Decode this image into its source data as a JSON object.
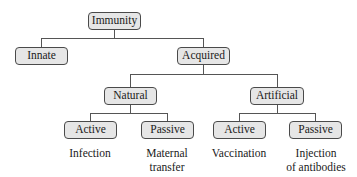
{
  "diagram": {
    "type": "tree",
    "root": "Immunity",
    "nodes": {
      "immunity": "Immunity",
      "innate": "Innate",
      "acquired": "Acquired",
      "natural": "Natural",
      "artificial": "Artificial",
      "natural_active": "Active",
      "natural_passive": "Passive",
      "artificial_active": "Active",
      "artificial_passive": "Passive"
    },
    "examples": {
      "natural_active": "Infection",
      "natural_passive_line1": "Maternal",
      "natural_passive_line2": "transfer",
      "artificial_active": "Vaccination",
      "artificial_passive_line1": "Injection",
      "artificial_passive_line2": "of antibodies"
    },
    "edges": [
      [
        "Immunity",
        "Innate"
      ],
      [
        "Immunity",
        "Acquired"
      ],
      [
        "Acquired",
        "Natural"
      ],
      [
        "Acquired",
        "Artificial"
      ],
      [
        "Natural",
        "Active"
      ],
      [
        "Natural",
        "Passive"
      ],
      [
        "Artificial",
        "Active"
      ],
      [
        "Artificial",
        "Passive"
      ]
    ],
    "colors": {
      "node_fill": "#e6e6e6",
      "node_border": "#4a4a4a",
      "line": "#555555"
    }
  }
}
